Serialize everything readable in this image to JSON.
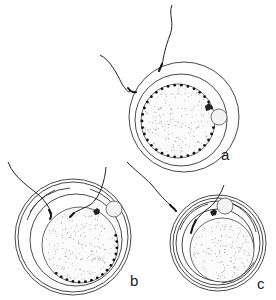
{
  "figure": {
    "type": "scientific-diagram",
    "panels": [
      {
        "id": "a",
        "label": "a",
        "center": [
          184,
          110
        ],
        "outer_radius": 58,
        "cortical_granules": "complete ring",
        "sperm_count": 2
      },
      {
        "id": "b",
        "label": "b",
        "center": [
          72,
          236
        ],
        "outer_radius": 58,
        "cortical_granules": "lower-right arc only",
        "sperm_count": 2
      },
      {
        "id": "c",
        "label": "c",
        "center": [
          217,
          243
        ],
        "outer_radius": 48,
        "cortical_granules": "none",
        "sperm_count": 2
      }
    ]
  },
  "colors": {
    "line": "#333333",
    "background": "#ffffff",
    "granule": "#111111"
  }
}
